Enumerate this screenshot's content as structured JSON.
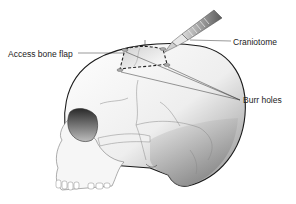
{
  "diagram": {
    "labels": {
      "access_bone_flap": "Access bone flap",
      "craniotome": "Craniotome",
      "burr_holes": "Burr holes"
    },
    "colors": {
      "outline": "#1a1a1a",
      "bone_light": "#f4f4f4",
      "bone_shade": "#9a9a9a",
      "flap_dash": "#222222",
      "tool_dark": "#555555"
    }
  }
}
